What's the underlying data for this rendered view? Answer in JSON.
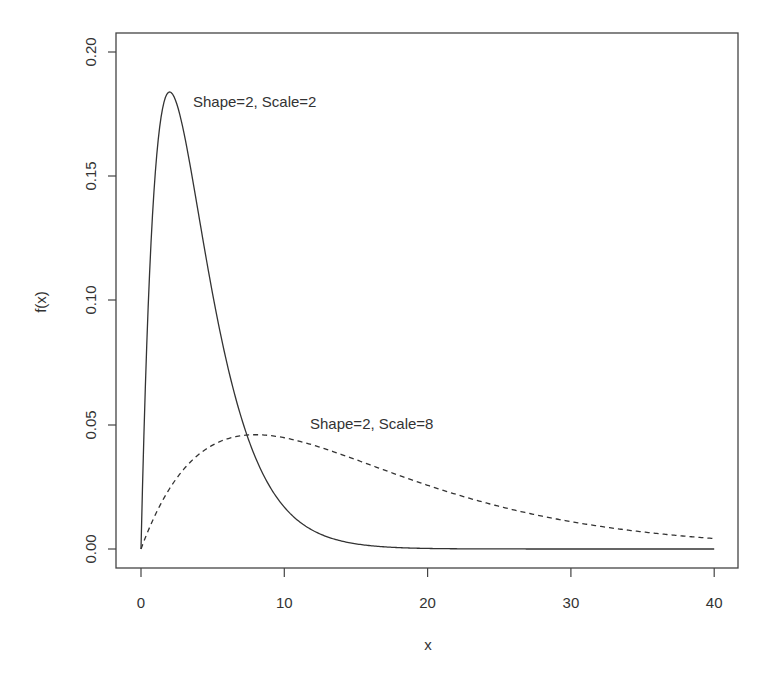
{
  "chart_data": {
    "type": "line",
    "title": "",
    "xlabel": "x",
    "ylabel": "f(x)",
    "xlim": [
      -1.6,
      41.6
    ],
    "ylim": [
      -0.0075,
      0.2075
    ],
    "x_ticks": [
      0,
      10,
      20,
      30,
      40
    ],
    "x_tick_labels": [
      "0",
      "10",
      "20",
      "30",
      "40"
    ],
    "y_ticks": [
      0.0,
      0.05,
      0.1,
      0.15,
      0.2
    ],
    "y_tick_labels": [
      "0.00",
      "0.05",
      "0.10",
      "0.15",
      "0.20"
    ],
    "grid": false,
    "legend": "none (inline annotations)",
    "series": [
      {
        "name": "Shape=2, Scale=2",
        "distribution": "gamma",
        "shape": 2,
        "scale": 2,
        "line_style": "solid",
        "color": "#333333",
        "x": [
          0,
          1,
          2,
          3,
          4,
          5,
          6,
          8,
          10,
          12,
          15,
          20,
          30,
          40
        ],
        "values": [
          0,
          0.1516,
          0.1839,
          0.1673,
          0.1353,
          0.1026,
          0.0747,
          0.0366,
          0.0168,
          0.0074,
          0.0021,
          0.0002,
          0.0,
          0.0
        ]
      },
      {
        "name": "Shape=2, Scale=8",
        "distribution": "gamma",
        "shape": 2,
        "scale": 8,
        "line_style": "dashed",
        "color": "#333333",
        "x": [
          0,
          2,
          4,
          6,
          8,
          10,
          15,
          20,
          25,
          30,
          35,
          40
        ],
        "values": [
          0,
          0.0243,
          0.0379,
          0.0443,
          0.046,
          0.0448,
          0.0361,
          0.0256,
          0.0171,
          0.011,
          0.0069,
          0.0042
        ]
      }
    ],
    "annotations": [
      {
        "text": "Shape=2, Scale=2",
        "x": 3.7,
        "y": 0.179
      },
      {
        "text": "Shape=2, Scale=8",
        "x": 11.8,
        "y": 0.0495
      }
    ]
  },
  "labels": {
    "xlabel": "x",
    "ylabel": "f(x)",
    "anno1": "Shape=2, Scale=2",
    "anno2": "Shape=2, Scale=8",
    "xt0": "0",
    "xt1": "10",
    "xt2": "20",
    "xt3": "30",
    "xt4": "40",
    "yt0": "0.00",
    "yt1": "0.05",
    "yt2": "0.10",
    "yt3": "0.15",
    "yt4": "0.20"
  }
}
